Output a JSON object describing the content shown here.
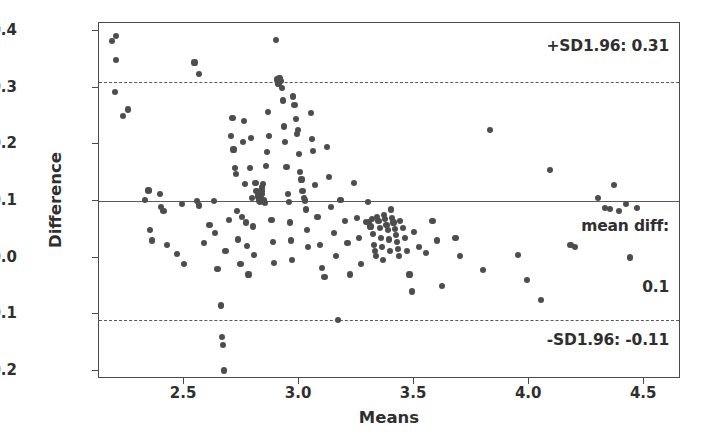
{
  "chart_data": {
    "type": "scatter",
    "title": "",
    "xlabel": "Means",
    "ylabel": "Difference",
    "xlim": [
      2.13,
      4.66
    ],
    "ylim": [
      -0.215,
      0.415
    ],
    "xticks": [
      2.5,
      3.0,
      3.5,
      4.0,
      4.5
    ],
    "xtick_labels": [
      "2.5",
      "3.0",
      "3.5",
      "4.0",
      "4.5"
    ],
    "yticks": [
      0.4,
      0.3,
      0.2,
      0.1,
      0.0,
      -0.1,
      -0.2
    ],
    "ytick_labels": [
      "0.4",
      "0.3",
      "0.2",
      "0.1",
      "0.0",
      "−0.1",
      "−0.2"
    ],
    "grid": false,
    "legend": null,
    "marker_color": "#4d4d4d",
    "line_color": "#5a5a5a",
    "reference_lines": [
      {
        "name": "upper-loa",
        "value": 0.31,
        "style": "dashed",
        "label": "+SD1.96: 0.31"
      },
      {
        "name": "mean-diff",
        "value": 0.1,
        "style": "solid",
        "label": "mean diff:"
      },
      {
        "name": "lower-loa",
        "value": -0.11,
        "style": "dashed",
        "label": "-SD1.96: -0.11"
      }
    ],
    "annotations": [
      {
        "name": "upper-loa-annotation",
        "text": "+SD1.96: 0.31"
      },
      {
        "name": "mean-diff-annotation-line1",
        "text": "mean diff:"
      },
      {
        "name": "mean-diff-annotation-line2",
        "text": "0.1"
      },
      {
        "name": "lower-loa-annotation",
        "text": "-SD1.96: -0.11"
      }
    ],
    "points": [
      [
        2.185,
        0.383
      ],
      [
        2.205,
        0.392
      ],
      [
        2.205,
        0.35
      ],
      [
        2.2,
        0.293
      ],
      [
        2.235,
        0.25
      ],
      [
        2.255,
        0.262
      ],
      [
        2.33,
        0.102
      ],
      [
        2.345,
        0.118
      ],
      [
        2.345,
        0.12
      ],
      [
        2.35,
        0.048
      ],
      [
        2.36,
        0.03
      ],
      [
        2.395,
        0.112
      ],
      [
        2.4,
        0.09
      ],
      [
        2.41,
        0.082
      ],
      [
        2.425,
        0.022
      ],
      [
        2.47,
        0.006
      ],
      [
        2.49,
        0.095
      ],
      [
        2.5,
        -0.012
      ],
      [
        2.545,
        0.345
      ],
      [
        2.565,
        0.325
      ],
      [
        2.555,
        0.1
      ],
      [
        2.565,
        0.092
      ],
      [
        2.585,
        0.026
      ],
      [
        2.61,
        0.058
      ],
      [
        2.63,
        0.1
      ],
      [
        2.635,
        0.044
      ],
      [
        2.645,
        -0.02
      ],
      [
        2.66,
        -0.085
      ],
      [
        2.665,
        -0.14
      ],
      [
        2.67,
        -0.155
      ],
      [
        2.675,
        -0.2
      ],
      [
        2.68,
        0.012
      ],
      [
        2.695,
        0.067
      ],
      [
        2.705,
        0.215
      ],
      [
        2.71,
        0.247
      ],
      [
        2.715,
        0.191
      ],
      [
        2.72,
        0.158
      ],
      [
        2.725,
        0.148
      ],
      [
        2.73,
        0.082
      ],
      [
        2.735,
        0.032
      ],
      [
        2.745,
        -0.012
      ],
      [
        2.75,
        0.072
      ],
      [
        2.755,
        0.205
      ],
      [
        2.76,
        0.242
      ],
      [
        2.765,
        0.13
      ],
      [
        2.77,
        0.062
      ],
      [
        2.775,
        0.02
      ],
      [
        2.78,
        -0.03
      ],
      [
        2.785,
        0.158
      ],
      [
        2.79,
        0.212
      ],
      [
        2.795,
        0.106
      ],
      [
        2.8,
        0.055
      ],
      [
        2.805,
        0.005
      ],
      [
        2.81,
        0.132
      ],
      [
        2.815,
        0.118
      ],
      [
        2.82,
        0.112
      ],
      [
        2.823,
        0.108
      ],
      [
        2.826,
        0.104
      ],
      [
        2.828,
        0.1
      ],
      [
        2.83,
        0.098
      ],
      [
        2.832,
        0.102
      ],
      [
        2.834,
        0.106
      ],
      [
        2.836,
        0.112
      ],
      [
        2.838,
        0.118
      ],
      [
        2.84,
        0.124
      ],
      [
        2.843,
        0.13
      ],
      [
        2.845,
        0.101
      ],
      [
        2.848,
        0.099
      ],
      [
        2.85,
        0.097
      ],
      [
        2.855,
        0.162
      ],
      [
        2.86,
        0.187
      ],
      [
        2.865,
        0.258
      ],
      [
        2.87,
        0.215
      ],
      [
        2.88,
        0.066
      ],
      [
        2.885,
        0.028
      ],
      [
        2.89,
        -0.01
      ],
      [
        2.9,
        0.385
      ],
      [
        2.905,
        0.315
      ],
      [
        2.91,
        0.308
      ],
      [
        2.915,
        0.318
      ],
      [
        2.92,
        0.312
      ],
      [
        2.925,
        0.3
      ],
      [
        2.93,
        0.278
      ],
      [
        2.935,
        0.232
      ],
      [
        2.94,
        0.205
      ],
      [
        2.945,
        0.16
      ],
      [
        2.95,
        0.112
      ],
      [
        2.955,
        0.098
      ],
      [
        2.96,
        0.062
      ],
      [
        2.965,
        0.03
      ],
      [
        2.97,
        -0.005
      ],
      [
        2.975,
        0.285
      ],
      [
        2.98,
        0.27
      ],
      [
        2.985,
        0.245
      ],
      [
        2.99,
        0.218
      ],
      [
        2.995,
        0.225
      ],
      [
        3.0,
        0.183
      ],
      [
        3.005,
        0.152
      ],
      [
        3.01,
        0.138
      ],
      [
        3.015,
        0.118
      ],
      [
        3.02,
        0.106
      ],
      [
        3.025,
        0.101
      ],
      [
        3.03,
        0.085
      ],
      [
        3.035,
        0.048
      ],
      [
        3.04,
        0.018
      ],
      [
        3.05,
        0.256
      ],
      [
        3.055,
        0.21
      ],
      [
        3.06,
        0.188
      ],
      [
        3.07,
        0.128
      ],
      [
        3.08,
        0.072
      ],
      [
        3.09,
        0.022
      ],
      [
        3.1,
        -0.018
      ],
      [
        3.11,
        -0.035
      ],
      [
        3.12,
        0.195
      ],
      [
        3.13,
        0.142
      ],
      [
        3.14,
        0.09
      ],
      [
        3.15,
        0.044
      ],
      [
        3.16,
        0.002
      ],
      [
        3.17,
        -0.11
      ],
      [
        3.18,
        0.102
      ],
      [
        3.2,
        0.065
      ],
      [
        3.21,
        0.025
      ],
      [
        3.22,
        -0.03
      ],
      [
        3.24,
        0.132
      ],
      [
        3.25,
        0.07
      ],
      [
        3.26,
        0.035
      ],
      [
        3.27,
        -0.012
      ],
      [
        3.29,
        0.063
      ],
      [
        3.3,
        0.098
      ],
      [
        3.305,
        0.062
      ],
      [
        3.31,
        0.055
      ],
      [
        3.315,
        0.068
      ],
      [
        3.32,
        0.042
      ],
      [
        3.325,
        0.022
      ],
      [
        3.33,
        0.012
      ],
      [
        3.335,
        0.003
      ],
      [
        3.34,
        0.072
      ],
      [
        3.345,
        0.065
      ],
      [
        3.35,
        0.052
      ],
      [
        3.355,
        0.035
      ],
      [
        3.36,
        0.018
      ],
      [
        3.365,
        -0.005
      ],
      [
        3.37,
        0.075
      ],
      [
        3.375,
        0.068
      ],
      [
        3.38,
        0.058
      ],
      [
        3.385,
        0.048
      ],
      [
        3.39,
        0.032
      ],
      [
        3.395,
        0.012
      ],
      [
        3.4,
        0.085
      ],
      [
        3.405,
        0.07
      ],
      [
        3.41,
        0.062
      ],
      [
        3.415,
        0.05
      ],
      [
        3.42,
        0.04
      ],
      [
        3.425,
        0.028
      ],
      [
        3.43,
        0.015
      ],
      [
        3.435,
        0.002
      ],
      [
        3.44,
        0.065
      ],
      [
        3.45,
        0.052
      ],
      [
        3.46,
        0.035
      ],
      [
        3.47,
        0.012
      ],
      [
        3.48,
        -0.03
      ],
      [
        3.49,
        -0.06
      ],
      [
        3.5,
        0.045
      ],
      [
        3.52,
        0.018
      ],
      [
        3.55,
        0.008
      ],
      [
        3.58,
        0.065
      ],
      [
        3.6,
        0.03
      ],
      [
        3.62,
        -0.05
      ],
      [
        3.68,
        0.035
      ],
      [
        3.7,
        0.002
      ],
      [
        3.8,
        -0.022
      ],
      [
        3.83,
        0.225
      ],
      [
        3.95,
        0.005
      ],
      [
        3.99,
        -0.04
      ],
      [
        4.05,
        -0.075
      ],
      [
        4.09,
        0.155
      ],
      [
        4.18,
        0.022
      ],
      [
        4.2,
        0.018
      ],
      [
        4.3,
        0.105
      ],
      [
        4.33,
        0.088
      ],
      [
        4.35,
        0.086
      ],
      [
        4.37,
        0.128
      ],
      [
        4.39,
        0.082
      ],
      [
        4.42,
        0.095
      ],
      [
        4.44,
        0.0
      ],
      [
        4.47,
        0.088
      ]
    ]
  }
}
